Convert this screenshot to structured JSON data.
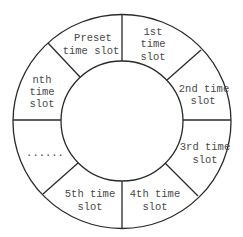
{
  "diagram": {
    "colors": {
      "line": "#2a2a2a",
      "text": "#4a4a4a",
      "background": "#ffffff"
    },
    "segments": [
      {
        "id": "preset",
        "lines": [
          "Preset",
          "time slot"
        ]
      },
      {
        "id": "slot-1",
        "lines": [
          "1st",
          "time",
          "slot"
        ]
      },
      {
        "id": "slot-2",
        "lines": [
          "2nd time",
          "slot"
        ]
      },
      {
        "id": "slot-3",
        "lines": [
          "3rd time",
          "slot"
        ]
      },
      {
        "id": "slot-4",
        "lines": [
          "4th time",
          "slot"
        ]
      },
      {
        "id": "slot-5",
        "lines": [
          "5th time",
          "slot"
        ]
      },
      {
        "id": "ellipsis",
        "lines": [
          "......"
        ]
      },
      {
        "id": "slot-n",
        "lines": [
          "nth",
          "time",
          "slot"
        ]
      }
    ]
  }
}
